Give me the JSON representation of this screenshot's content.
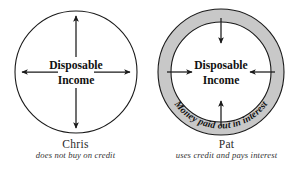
{
  "figure": {
    "background_color": "#ffffff",
    "stroke_color": "#1a1a1a",
    "ring_fill_color": "#c8c8c8",
    "panels": [
      {
        "id": "chris",
        "person_name": "Chris",
        "description": "does not buy on credit",
        "center_label_line1": "Disposable",
        "center_label_line2": "Income",
        "circle": {
          "type": "single",
          "center_x": 76,
          "center_y": 72,
          "radius": 61
        },
        "arrows": {
          "direction": "outward",
          "count": 4,
          "headings": [
            "up",
            "right",
            "down",
            "left"
          ]
        },
        "ring_label": ""
      },
      {
        "id": "pat",
        "person_name": "Pat",
        "description": "uses credit and pays interest",
        "center_label_line1": "Disposable",
        "center_label_line2": "Income",
        "circle": {
          "type": "annulus",
          "center_x": 70,
          "center_y": 72,
          "outer_radius": 63,
          "inner_radius": 50
        },
        "arrows": {
          "direction": "inward",
          "count": 4,
          "headings": [
            "up",
            "right",
            "down",
            "left"
          ]
        },
        "ring_label": "Money paid out in interest"
      }
    ]
  }
}
